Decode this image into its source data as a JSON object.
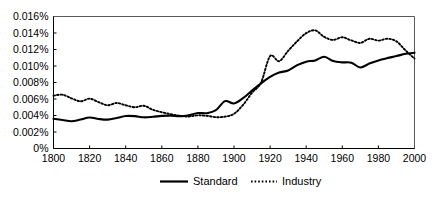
{
  "chart_data": {
    "type": "line",
    "title": "",
    "subtitle": "",
    "xlabel": "",
    "ylabel": "",
    "xlim": [
      1800,
      2000
    ],
    "ylim": [
      0,
      0.016
    ],
    "grid": false,
    "legend_position": "bottom-center",
    "y_tick_labels": [
      "0%",
      "0.002%",
      "0.004%",
      "0.006%",
      "0.008%",
      "0.010%",
      "0.012%",
      "0.014%",
      "0.016%"
    ],
    "y_tick_values": [
      0,
      0.002,
      0.004,
      0.006,
      0.008,
      0.01,
      0.012,
      0.014,
      0.016
    ],
    "x_tick_labels": [
      "1800",
      "1820",
      "1840",
      "1860",
      "1880",
      "1900",
      "1920",
      "1940",
      "1960",
      "1980",
      "2000"
    ],
    "x_tick_values": [
      1800,
      1820,
      1840,
      1860,
      1880,
      1900,
      1920,
      1940,
      1960,
      1980,
      2000
    ],
    "x": [
      1800,
      1805,
      1810,
      1815,
      1820,
      1825,
      1830,
      1835,
      1840,
      1845,
      1850,
      1855,
      1860,
      1865,
      1870,
      1875,
      1880,
      1885,
      1890,
      1895,
      1900,
      1905,
      1910,
      1915,
      1920,
      1925,
      1930,
      1935,
      1940,
      1945,
      1950,
      1955,
      1960,
      1965,
      1970,
      1975,
      1980,
      1985,
      1990,
      1995,
      2000
    ],
    "series": [
      {
        "name": "Standard",
        "style": "solid",
        "color": "#000000",
        "values": [
          0.0036,
          0.00345,
          0.0033,
          0.00352,
          0.00376,
          0.00358,
          0.0035,
          0.0037,
          0.00394,
          0.00392,
          0.00378,
          0.00384,
          0.00396,
          0.00398,
          0.00392,
          0.00404,
          0.0043,
          0.00428,
          0.00464,
          0.00574,
          0.00546,
          0.0061,
          0.00702,
          0.0079,
          0.00868,
          0.0092,
          0.00946,
          0.0101,
          0.01052,
          0.01068,
          0.01112,
          0.0106,
          0.01044,
          0.0104,
          0.00982,
          0.0103,
          0.01068,
          0.01096,
          0.0112,
          0.01148,
          0.0116
        ]
      },
      {
        "name": "Industry",
        "style": "dotted",
        "color": "#000000",
        "values": [
          0.0064,
          0.00652,
          0.00608,
          0.00572,
          0.00604,
          0.00562,
          0.00524,
          0.00552,
          0.00524,
          0.005,
          0.00518,
          0.0047,
          0.0044,
          0.00416,
          0.00396,
          0.00388,
          0.00402,
          0.00396,
          0.0038,
          0.00386,
          0.0042,
          0.00528,
          0.00676,
          0.008,
          0.0112,
          0.01058,
          0.01184,
          0.013,
          0.01398,
          0.01432,
          0.01352,
          0.01316,
          0.01348,
          0.0131,
          0.0128,
          0.0133,
          0.01308,
          0.0133,
          0.01298,
          0.0119,
          0.0109
        ]
      }
    ]
  },
  "legend": {
    "items": [
      {
        "label": "Standard",
        "style": "solid"
      },
      {
        "label": "Industry",
        "style": "dotted"
      }
    ]
  }
}
